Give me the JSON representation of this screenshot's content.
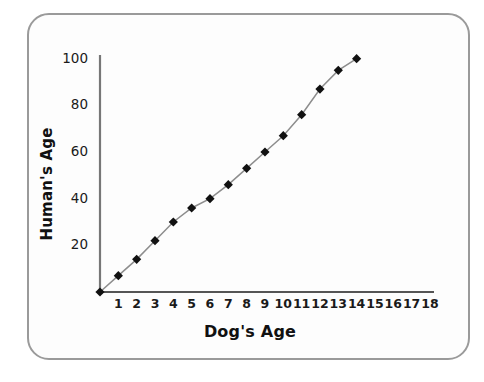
{
  "figure": {
    "frame_color": "#9a9a9a",
    "background": "#fdfdfd"
  },
  "chart_data": {
    "type": "line",
    "title": "",
    "xlabel": "Dog's Age",
    "ylabel": "Human's Age",
    "xlim": [
      0,
      18
    ],
    "ylim": [
      0,
      100
    ],
    "grid": false,
    "legend": "none",
    "marker": "diamond",
    "marker_color": "#111111",
    "line_color": "#8d8d8d",
    "xticks": [
      1,
      2,
      3,
      4,
      5,
      6,
      7,
      8,
      9,
      10,
      11,
      12,
      13,
      14,
      15,
      16,
      17,
      18
    ],
    "xtick_labels": [
      "1",
      "2",
      "3",
      "4",
      "5",
      "6",
      "7",
      "8",
      "9",
      "10",
      "11",
      "12",
      "13",
      "14",
      "15",
      "16",
      "17",
      "18"
    ],
    "yticks": [
      20,
      40,
      60,
      80,
      100
    ],
    "ytick_labels": [
      "20",
      "40",
      "60",
      "80",
      "100"
    ],
    "x": [
      0,
      1,
      2,
      3,
      4,
      5,
      6,
      7,
      8,
      9,
      10,
      11,
      12,
      13,
      14
    ],
    "values": [
      0,
      7,
      14,
      22,
      30,
      36,
      40,
      46,
      53,
      60,
      67,
      76,
      87,
      95,
      100
    ],
    "series": [
      {
        "name": "Dog to human age",
        "x": [
          0,
          1,
          2,
          3,
          4,
          5,
          6,
          7,
          8,
          9,
          10,
          11,
          12,
          13,
          14
        ],
        "values": [
          0,
          7,
          14,
          22,
          30,
          36,
          40,
          46,
          53,
          60,
          67,
          76,
          87,
          95,
          100
        ]
      }
    ]
  }
}
